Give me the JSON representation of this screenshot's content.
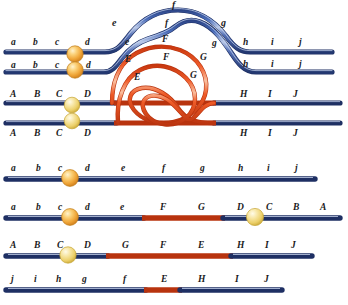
{
  "figure": {
    "colors": {
      "blue_strand": "#3c5ca8",
      "blue_strand_dark": "#22376f",
      "blue_strand_light": "#8fa6d8",
      "orange_strand": "#e8502a",
      "orange_strand_light": "#f79b6a",
      "orange_strand_dark": "#c03a14",
      "sphere_gold": "#f0a93c",
      "sphere_gold_light": "#fde0a0",
      "sphere_pale": "#f2d679",
      "label_text": "#1a1a22",
      "background": "#ffffff"
    }
  },
  "panel_top": {
    "name": "paired-chromosomes-with-loop",
    "lower_case_row1": [
      "a",
      "b",
      "c",
      "d"
    ],
    "lower_case_row2": [
      "a",
      "b",
      "c",
      "d"
    ],
    "loop_outer_left": "e",
    "loop_outer_top": "f",
    "loop_outer_right": "g",
    "loop_inner_left": "e",
    "loop_inner_top": "f",
    "loop_inner_right": "g",
    "right_tail_row1": [
      "h",
      "i",
      "j"
    ],
    "right_tail_row2": [
      "h",
      "i",
      "j"
    ],
    "upper_case_row3": [
      "A",
      "B",
      "C",
      "D"
    ],
    "upper_case_row4": [
      "A",
      "B",
      "C",
      "D"
    ],
    "orange_loop_outer_left": "E",
    "orange_loop_outer_top": "F",
    "orange_loop_outer_right": "G",
    "orange_loop_inner_left": "E",
    "orange_loop_inner_top": "F",
    "orange_loop_inner_right": "G",
    "right_tail_row3": [
      "H",
      "I",
      "J"
    ],
    "right_tail_row4": [
      "H",
      "I",
      "J"
    ]
  },
  "panel_bottom": {
    "name": "resulting-recombinant-strands",
    "strands": [
      {
        "id": "strand-1",
        "labels_above": [
          "a",
          "b",
          "c",
          "d",
          "e",
          "f",
          "g",
          "h",
          "i",
          "j"
        ],
        "labels_below": [],
        "has_sphere": true,
        "orange_segments": []
      },
      {
        "id": "strand-2",
        "labels_above": [
          "a",
          "b",
          "c",
          "d",
          "e",
          "F",
          "G",
          "D",
          "C",
          "B",
          "A"
        ],
        "labels_below": [],
        "has_sphere": true,
        "second_sphere": true,
        "orange_segments": [
          "F",
          "G"
        ]
      },
      {
        "id": "strand-3",
        "labels_above": [
          "A",
          "B",
          "C",
          "D",
          "G",
          "F",
          "E",
          "H",
          "I",
          "J"
        ],
        "labels_below": [],
        "has_sphere": true,
        "orange_segments": [
          "G",
          "F",
          "E"
        ]
      },
      {
        "id": "strand-4",
        "labels_above": [
          "j",
          "i",
          "h",
          "g",
          "f",
          "E",
          "H",
          "I",
          "J"
        ],
        "labels_below": [],
        "has_sphere": false,
        "orange_segments": [
          "E"
        ]
      }
    ]
  },
  "labels": {
    "t_r1_a": "a",
    "t_r1_b": "b",
    "t_r1_c": "c",
    "t_r1_d": "d",
    "t_r2_a": "a",
    "t_r2_b": "b",
    "t_r2_c": "c",
    "t_r2_d": "d",
    "t_e_out": "e",
    "t_f_out": "f",
    "t_g_out": "g",
    "t_e_in": "e",
    "t_f_in": "f",
    "t_g_in": "g",
    "t_h1": "h",
    "t_i1": "i",
    "t_j1": "j",
    "t_h2": "h",
    "t_i2": "i",
    "t_j2": "j",
    "t_r3_A": "A",
    "t_r3_B": "B",
    "t_r3_C": "C",
    "t_r3_D": "D",
    "t_r4_A": "A",
    "t_r4_B": "B",
    "t_r4_C": "C",
    "t_r4_D": "D",
    "t_E_out": "E",
    "t_F_out": "F",
    "t_G_out": "G",
    "t_E_in": "E",
    "t_F_in": "F",
    "t_G_in": "G",
    "t_H3": "H",
    "t_I3": "I",
    "t_J3": "J",
    "t_H4": "H",
    "t_I4": "I",
    "t_J4": "J",
    "b1_a": "a",
    "b1_b": "b",
    "b1_c": "c",
    "b1_d": "d",
    "b1_e": "e",
    "b1_f": "f",
    "b1_g": "g",
    "b1_h": "h",
    "b1_i": "i",
    "b1_j": "j",
    "b2_a": "a",
    "b2_b": "b",
    "b2_c": "c",
    "b2_d": "d",
    "b2_e": "e",
    "b2_F": "F",
    "b2_G": "G",
    "b2_D": "D",
    "b2_C": "C",
    "b2_B": "B",
    "b2_A": "A",
    "b3_A": "A",
    "b3_B": "B",
    "b3_C": "C",
    "b3_D": "D",
    "b3_G": "G",
    "b3_F": "F",
    "b3_E": "E",
    "b3_H": "H",
    "b3_I": "I",
    "b3_J": "J",
    "b4_j": "j",
    "b4_i": "i",
    "b4_h": "h",
    "b4_g": "g",
    "b4_f": "f",
    "b4_E": "E",
    "b4_H": "H",
    "b4_I": "I",
    "b4_J": "J"
  }
}
